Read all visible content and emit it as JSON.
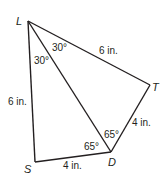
{
  "diagram": {
    "type": "geometry-figure",
    "vertices": [
      {
        "id": "L",
        "label": "L",
        "x": 28,
        "y": 21
      },
      {
        "id": "T",
        "label": "T",
        "x": 150,
        "y": 85
      },
      {
        "id": "D",
        "label": "D",
        "x": 111,
        "y": 152
      },
      {
        "id": "S",
        "label": "S",
        "x": 35,
        "y": 162
      }
    ],
    "segments": [
      {
        "from": "L",
        "to": "T",
        "label": "6 in."
      },
      {
        "from": "T",
        "to": "D",
        "label": "4 in."
      },
      {
        "from": "D",
        "to": "S",
        "label": "4 in."
      },
      {
        "from": "S",
        "to": "L",
        "label": "6 in."
      },
      {
        "from": "L",
        "to": "D",
        "label": ""
      }
    ],
    "angles": [
      {
        "at": "L",
        "between": "DLT",
        "label": "30°"
      },
      {
        "at": "L",
        "between": "SLD",
        "label": "30°"
      },
      {
        "at": "D",
        "between": "LDT",
        "label": "65°"
      },
      {
        "at": "D",
        "between": "SDL",
        "label": "65°"
      }
    ],
    "line_color": "#231f20"
  }
}
